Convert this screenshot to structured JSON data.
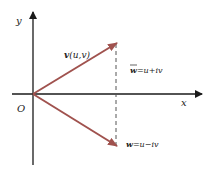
{
  "diagram": {
    "axes": {
      "x_label": "x",
      "y_label": "y",
      "origin_label": "O"
    },
    "vectors": [
      {
        "id": "v",
        "label_bold": "v",
        "label_rest": "(u,v)",
        "direction": "up-right"
      },
      {
        "id": "w",
        "label_bold": "w",
        "label_rest": "=u−iv",
        "direction": "down-right"
      }
    ],
    "conjugate_label": {
      "bar_symbol": "w",
      "rest": "=u+iv"
    },
    "colors": {
      "vector": "#a0524e",
      "axis": "#1a1a1a",
      "dashed": "#555555"
    }
  }
}
